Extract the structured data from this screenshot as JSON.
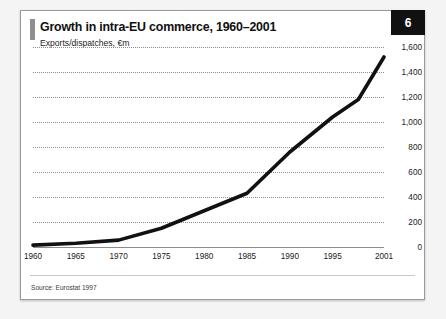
{
  "card": {
    "badge_number": "6",
    "title": "Growth in intra-EU commerce, 1960–2001",
    "subtitle": "Exports/dispatches, €m",
    "source": "Source: Eurostat 1997"
  },
  "colors": {
    "line": "#111111",
    "grid": "#8d8d8d",
    "axis": "#8c8c8c",
    "badge_bg": "#111111",
    "badge_text": "#ffffff",
    "card_bg": "#ffffff",
    "card_border": "#9a9a9a",
    "page_bg": "#f4f4f4",
    "accent_bar": "#8e8e8e"
  },
  "chart_data": {
    "type": "line",
    "title": "Growth in intra-EU commerce, 1960–2001",
    "subtitle": "Exports/dispatches, €m",
    "xlabel": "",
    "ylabel": "",
    "ylim": [
      0,
      1600
    ],
    "yticks": [
      0,
      200,
      400,
      600,
      800,
      1000,
      1200,
      1400,
      1600
    ],
    "ytick_labels": [
      "0",
      "200",
      "400",
      "600",
      "800",
      "1,000",
      "1,200",
      "1,400",
      "1,600"
    ],
    "xlim": [
      1960,
      2001
    ],
    "xticks": [
      1960,
      1965,
      1970,
      1975,
      1980,
      1985,
      1990,
      1995,
      2001
    ],
    "xtick_labels": [
      "1960",
      "1965",
      "1970",
      "1975",
      "1980",
      "1985",
      "1990",
      "1995",
      "2001"
    ],
    "grid": "horizontal-dotted",
    "legend": "none",
    "series": [
      {
        "name": "Intra-EU exports/dispatches",
        "x": [
          1960,
          1965,
          1970,
          1975,
          1980,
          1985,
          1990,
          1995,
          1998,
          2001
        ],
        "values": [
          15,
          30,
          55,
          150,
          290,
          430,
          760,
          1040,
          1180,
          1520
        ]
      }
    ],
    "source": "Source: Eurostat 1997"
  }
}
